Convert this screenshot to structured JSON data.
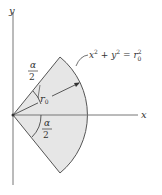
{
  "diagram": {
    "axes": {
      "x_label": "x",
      "y_label": "y"
    },
    "sector": {
      "radius_label": "r",
      "radius_subscript": "0",
      "half_angle_top": {
        "numerator": "α",
        "denominator": "2"
      },
      "half_angle_bottom": {
        "numerator": "α",
        "denominator": "2"
      },
      "fill_color": "#e6e6e6",
      "stroke_color": "#555555"
    },
    "equation": {
      "x": "x",
      "x_exp": "2",
      "plus": "+",
      "y": "y",
      "y_exp": "2",
      "eq": "=",
      "r": "r",
      "r_sub": "0",
      "r_exp": "2"
    }
  }
}
